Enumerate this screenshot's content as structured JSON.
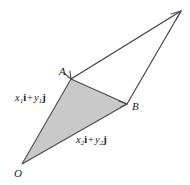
{
  "figure": {
    "kind": "vector-triangle-diagram",
    "width": 190,
    "height": 185,
    "background_color": "#ffffff",
    "shaded_fill_color": "#c9c9c9",
    "stroke_color": "#3a3a3a",
    "label_color": "#1a1a1a"
  },
  "vertices": [
    {
      "id": "O",
      "label": "O",
      "x": 22,
      "y": 164,
      "label_x": 14,
      "label_y": 168
    },
    {
      "id": "A",
      "label": "A",
      "x": 71,
      "y": 79,
      "label_x": 59,
      "label_y": 66
    },
    {
      "id": "B",
      "label": "B",
      "x": 127,
      "y": 104,
      "label_x": 132,
      "label_y": 101
    },
    {
      "id": "apex",
      "label": "",
      "x": 181,
      "y": 11,
      "label_x": 0,
      "label_y": 0
    }
  ],
  "vector_labels": [
    {
      "id": "OA",
      "x": 15,
      "y": 93,
      "component_x": "x",
      "component_x_sub": "1",
      "basis_x": "i",
      "operator": "+",
      "component_y": "y",
      "component_y_sub": "1",
      "basis_y": "j",
      "plain": "x1i + y1j"
    },
    {
      "id": "OB",
      "x": 76,
      "y": 135,
      "component_x": "x",
      "component_x_sub": "2",
      "basis_x": "i",
      "operator": "+",
      "component_y": "y",
      "component_y_sub": "2",
      "basis_y": "j",
      "plain": "x2i + y2j"
    }
  ],
  "shaded_triangle": {
    "points": "22,164 71,79 127,104",
    "fill": "#c9c9c9",
    "stroke": "#4a4a4a"
  },
  "outline_paths": [
    {
      "id": "edge-A-to-apex",
      "from": "A",
      "to": "apex",
      "d": "M 71,79 L 181,11"
    },
    {
      "id": "edge-apex-to-B",
      "from": "apex",
      "to": "B",
      "d": "M 181,11 L 127,104"
    }
  ],
  "arrowheads": [
    {
      "id": "arrowhead-at-A",
      "at": "A",
      "x": 71,
      "y": 79,
      "angle": -60
    },
    {
      "id": "arrowhead-at-B",
      "at": "B",
      "x": 127,
      "y": 104,
      "angle": -24
    },
    {
      "id": "arrowhead-at-apex",
      "at": "apex",
      "x": 181,
      "y": 11,
      "angle": -32
    }
  ]
}
